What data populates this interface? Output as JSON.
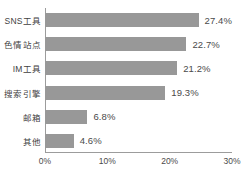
{
  "chart_data": {
    "type": "bar",
    "orientation": "horizontal",
    "title": "",
    "subtitle": "",
    "xlabel": "",
    "ylabel": "",
    "xlim": [
      0,
      30
    ],
    "x_ticks": [
      "0%",
      "10%",
      "20%",
      "30%"
    ],
    "x_tick_values": [
      0,
      10,
      20,
      30
    ],
    "grid": false,
    "legend": false,
    "categories": [
      "SNS工具",
      "色情站点",
      "IM工具",
      "搜索引擎",
      "邮箱",
      "其他"
    ],
    "values": [
      27.4,
      22.7,
      21.2,
      19.3,
      6.8,
      4.6
    ],
    "data_labels": [
      "27.4%",
      "22.7%",
      "21.2%",
      "19.3%",
      "6.8%",
      "4.6%"
    ],
    "bars": [
      {
        "category": "SNS工具",
        "value": 27.4,
        "label": "27.4%"
      },
      {
        "category": "色情站点",
        "value": 22.7,
        "label": "22.7%"
      },
      {
        "category": "IM工具",
        "value": 21.2,
        "label": "21.2%"
      },
      {
        "category": "搜索引擎",
        "value": 19.3,
        "label": "19.3%"
      },
      {
        "category": "邮箱",
        "value": 6.8,
        "label": "6.8%"
      },
      {
        "category": "其他",
        "value": 4.6,
        "label": "4.6%"
      }
    ],
    "colors": {
      "bar": "#989898",
      "axis": "#9c9c9c",
      "text": "#3f3f3f",
      "value_text": "#4a4a4a",
      "background": "#ffffff"
    }
  }
}
